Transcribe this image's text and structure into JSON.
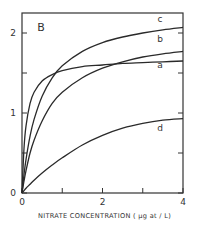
{
  "chart_data": {
    "type": "line",
    "title": "",
    "panel_label": "B",
    "xlabel": "NITRATE CONCENTRATION ( μg at / L)",
    "ylabel": "",
    "xlim": [
      0,
      4
    ],
    "ylim": [
      0,
      2.25
    ],
    "x_ticks": [
      0,
      1,
      2,
      3,
      4
    ],
    "x_tick_labels": [
      "0",
      "",
      "2",
      "",
      "4"
    ],
    "y_ticks": [
      0,
      0.5,
      1,
      1.5,
      2
    ],
    "y_tick_labels": [
      "0",
      "",
      "1",
      "",
      "2"
    ],
    "grid": false,
    "legend": "inline curve labels at right end",
    "x": [
      0,
      0.05,
      0.1,
      0.2,
      0.3,
      0.5,
      0.75,
      1,
      1.5,
      2,
      2.5,
      3,
      3.5,
      4
    ],
    "series": [
      {
        "name": "a",
        "values": [
          0,
          0.56,
          0.84,
          1.12,
          1.26,
          1.4,
          1.48,
          1.53,
          1.58,
          1.6,
          1.62,
          1.63,
          1.64,
          1.65
        ]
      },
      {
        "name": "b",
        "values": [
          0,
          0.15,
          0.28,
          0.5,
          0.66,
          0.9,
          1.12,
          1.26,
          1.44,
          1.56,
          1.64,
          1.7,
          1.74,
          1.77
        ]
      },
      {
        "name": "c",
        "values": [
          0,
          0.23,
          0.42,
          0.71,
          0.92,
          1.21,
          1.44,
          1.59,
          1.77,
          1.88,
          1.95,
          2.0,
          2.04,
          2.07
        ]
      },
      {
        "name": "d",
        "values": [
          0,
          0.03,
          0.06,
          0.11,
          0.16,
          0.25,
          0.35,
          0.44,
          0.6,
          0.72,
          0.81,
          0.87,
          0.91,
          0.93
        ]
      }
    ]
  }
}
